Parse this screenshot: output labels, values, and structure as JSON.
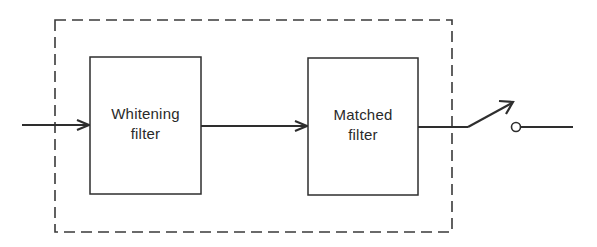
{
  "diagram": {
    "type": "block-diagram",
    "colors": {
      "stroke": "#2e2e2e",
      "background": "#ffffff",
      "text": "#2a2a2a"
    },
    "enclosure": {
      "style": "dashed",
      "x": 55,
      "y": 20,
      "width": 397,
      "height": 212
    },
    "blocks": [
      {
        "id": "whitening-filter",
        "line1": "Whitening",
        "line2": "filter",
        "x": 90,
        "y": 57,
        "width": 111,
        "height": 137
      },
      {
        "id": "matched-filter",
        "line1": "Matched",
        "line2": "filter",
        "x": 308,
        "y": 58,
        "width": 110,
        "height": 137
      }
    ],
    "connections": [
      {
        "from": "input",
        "to": "whitening-filter",
        "arrow": true
      },
      {
        "from": "whitening-filter",
        "to": "matched-filter",
        "arrow": true
      },
      {
        "from": "matched-filter",
        "to": "sampling-switch",
        "arrow": false
      },
      {
        "from": "sampling-switch",
        "to": "output",
        "arrow": false
      }
    ],
    "switch": {
      "type": "sampling-switch",
      "state": "open"
    }
  }
}
